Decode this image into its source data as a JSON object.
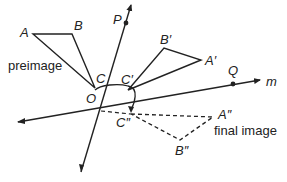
{
  "diagram": {
    "type": "geometry-reflection",
    "lines": [
      {
        "id": "p",
        "label": "P",
        "point_label": "P",
        "from": [
          81,
          172
        ],
        "to": [
          131,
          5
        ],
        "point": [
          126,
          24
        ]
      },
      {
        "id": "m",
        "label": "m",
        "point_label": "Q",
        "from": [
          18,
          122
        ],
        "to": [
          260,
          80
        ],
        "point": [
          233,
          82
        ]
      }
    ],
    "intersection": {
      "label": "O",
      "position": [
        101,
        111
      ]
    },
    "preimage": {
      "caption": "preimage",
      "vertices": {
        "A": [
          33,
          34
        ],
        "B": [
          72,
          34
        ],
        "C": [
          95,
          88
        ]
      },
      "labels": {
        "A": "A",
        "B": "B",
        "C": "C"
      }
    },
    "first_image": {
      "vertices": {
        "A'": [
          201,
          60
        ],
        "B'": [
          164,
          48
        ],
        "C'": [
          128,
          90
        ]
      },
      "labels": {
        "A'": "A'",
        "B'": "B'",
        "C'": "C'"
      }
    },
    "final_image": {
      "caption": "final image",
      "style": "dashed",
      "vertices": {
        "A''": [
          213,
          117
        ],
        "B''": [
          180,
          140
        ],
        "C''": [
          131,
          114
        ]
      },
      "labels": {
        "A''": "A''",
        "B''": "B''",
        "C''": "C''"
      }
    },
    "labels": {
      "A": "A",
      "B": "B",
      "C": "C",
      "A1": "A′",
      "B1": "B′",
      "C1": "C′",
      "A2": "A″",
      "B2": "B″",
      "C2": "C″",
      "O": "O",
      "P": "P",
      "Q": "Q",
      "m": "m",
      "preimage": "preimage",
      "final_image": "final image"
    },
    "colors": {
      "stroke": "#222222",
      "background": "#ffffff"
    }
  }
}
